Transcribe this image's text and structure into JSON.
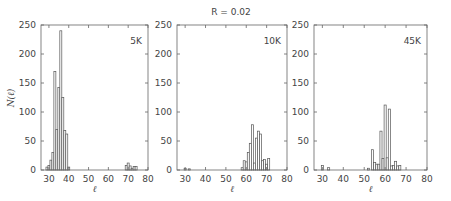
{
  "chart_data": {
    "type": "bar",
    "title": "R = 0.02",
    "ylabel": "N(ℓ)",
    "xlabel": "ℓ",
    "xlim": [
      26,
      80
    ],
    "ylim": [
      0,
      250
    ],
    "xticks": [
      30,
      40,
      50,
      60,
      70,
      80
    ],
    "yticks": [
      0,
      50,
      100,
      150,
      200,
      250
    ],
    "grid": false,
    "panels": [
      {
        "label": "5K",
        "bins": [
          {
            "x": 29,
            "y": 5
          },
          {
            "x": 30,
            "y": 8
          },
          {
            "x": 31,
            "y": 17
          },
          {
            "x": 32,
            "y": 30
          },
          {
            "x": 33,
            "y": 170
          },
          {
            "x": 34,
            "y": 70
          },
          {
            "x": 35,
            "y": 142
          },
          {
            "x": 36,
            "y": 240
          },
          {
            "x": 37,
            "y": 125
          },
          {
            "x": 38,
            "y": 68
          },
          {
            "x": 39,
            "y": 62
          },
          {
            "x": 40,
            "y": 5
          },
          {
            "x": 69,
            "y": 8
          },
          {
            "x": 70,
            "y": 12
          },
          {
            "x": 71,
            "y": 7
          },
          {
            "x": 72,
            "y": 3
          },
          {
            "x": 73,
            "y": 6
          },
          {
            "x": 74,
            "y": 6
          }
        ]
      },
      {
        "label": "10K",
        "bins": [
          {
            "x": 30,
            "y": 3
          },
          {
            "x": 32,
            "y": 2
          },
          {
            "x": 58,
            "y": 4
          },
          {
            "x": 59,
            "y": 16
          },
          {
            "x": 60,
            "y": 14
          },
          {
            "x": 61,
            "y": 30
          },
          {
            "x": 62,
            "y": 46
          },
          {
            "x": 63,
            "y": 78
          },
          {
            "x": 64,
            "y": 12
          },
          {
            "x": 65,
            "y": 55
          },
          {
            "x": 66,
            "y": 67
          },
          {
            "x": 67,
            "y": 62
          },
          {
            "x": 68,
            "y": 16
          },
          {
            "x": 69,
            "y": 18
          },
          {
            "x": 70,
            "y": 10
          },
          {
            "x": 71,
            "y": 20
          }
        ]
      },
      {
        "label": "45K",
        "bins": [
          {
            "x": 30,
            "y": 8
          },
          {
            "x": 33,
            "y": 4
          },
          {
            "x": 52,
            "y": 3
          },
          {
            "x": 54,
            "y": 35
          },
          {
            "x": 55,
            "y": 13
          },
          {
            "x": 56,
            "y": 10
          },
          {
            "x": 57,
            "y": 10
          },
          {
            "x": 58,
            "y": 67
          },
          {
            "x": 59,
            "y": 20
          },
          {
            "x": 60,
            "y": 112
          },
          {
            "x": 61,
            "y": 21
          },
          {
            "x": 62,
            "y": 105
          },
          {
            "x": 63,
            "y": 7
          },
          {
            "x": 64,
            "y": 8
          },
          {
            "x": 65,
            "y": 15
          },
          {
            "x": 66,
            "y": 7
          },
          {
            "x": 67,
            "y": 8
          }
        ]
      }
    ]
  }
}
